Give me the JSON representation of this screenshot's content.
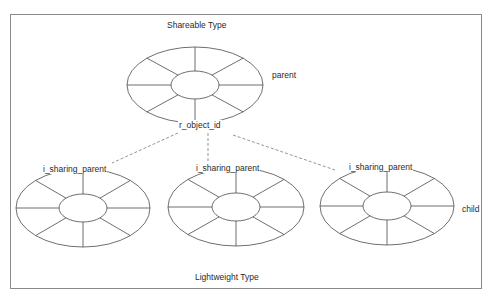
{
  "diagram": {
    "top_title": "Shareable Type",
    "bottom_title": "Lightweight Type",
    "parent": {
      "role_label": "parent",
      "key_label": "r_object_id",
      "center": [
        195,
        85
      ],
      "outer": [
        68,
        38
      ],
      "inner": [
        24,
        14
      ]
    },
    "children": [
      {
        "link_label": "i_sharing_parent",
        "center": [
          83,
          208
        ],
        "outer": [
          67,
          39
        ],
        "inner": [
          24,
          14
        ]
      },
      {
        "link_label": "i_sharing_parent",
        "center": [
          236,
          207
        ],
        "outer": [
          68,
          39
        ],
        "inner": [
          24,
          14
        ]
      },
      {
        "link_label": "i_sharing_parent",
        "center": [
          387,
          206
        ],
        "outer": [
          67,
          39
        ],
        "inner": [
          24,
          14
        ]
      }
    ],
    "child_role_label": "child",
    "connectors": [
      {
        "from": [
          178,
          133
        ],
        "to": [
          112,
          163
        ],
        "style": "dashed"
      },
      {
        "from": [
          208,
          133
        ],
        "to": [
          208,
          165
        ],
        "style": "dashed"
      },
      {
        "from": [
          233,
          135
        ],
        "to": [
          335,
          170
        ],
        "style": "dashed"
      }
    ],
    "colors": {
      "line": "#4a4a4a",
      "frame": "#8a8a8a",
      "text": "#2a2a2a"
    }
  }
}
